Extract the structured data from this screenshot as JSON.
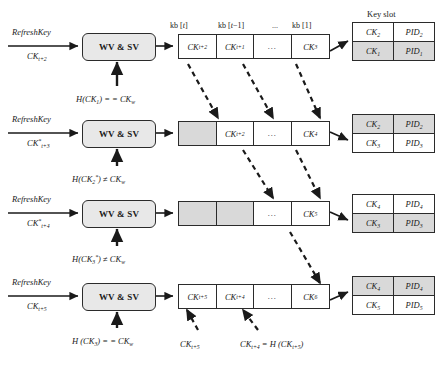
{
  "figure": {
    "key_slot_title": "Key slot",
    "process_box_label": "WV & SV",
    "buffer_headers": [
      "kb [t]",
      "kb [t−1]",
      "...",
      "kb [1]"
    ],
    "rows": [
      {
        "input_top": "RefreshKey",
        "input_bottom": "CK",
        "input_bottom_sub": "t+2",
        "input_bottom_star": "",
        "condition": "H(CK",
        "condition_sub": "1",
        "condition_star": "",
        "condition_tail": ") = = CK",
        "condition_tail_sub": "w",
        "cells": [
          {
            "text": "CK",
            "sub": "t+2",
            "shaded": false,
            "dots": false
          },
          {
            "text": "CK",
            "sub": "t+1",
            "shaded": false,
            "dots": false
          },
          {
            "text": "...",
            "sub": "",
            "shaded": false,
            "dots": true
          },
          {
            "text": "CK",
            "sub": "3",
            "shaded": false,
            "dots": false
          }
        ],
        "slot": [
          {
            "ck": "CK",
            "ck_sub": "2",
            "pid": "PID",
            "pid_sub": "2",
            "shaded": false
          },
          {
            "ck": "CK",
            "ck_sub": "1",
            "pid": "PID",
            "pid_sub": "1",
            "shaded": true
          }
        ]
      },
      {
        "input_top": "RefreshKey",
        "input_bottom": "CK",
        "input_bottom_sub": "t+3",
        "input_bottom_star": "*",
        "condition": "H(CK",
        "condition_sub": "2",
        "condition_star": "*",
        "condition_tail": ") ≠ CK",
        "condition_tail_sub": "w",
        "cells": [
          {
            "text": "",
            "sub": "",
            "shaded": true,
            "dots": false
          },
          {
            "text": "CK",
            "sub": "t+2",
            "shaded": false,
            "dots": false
          },
          {
            "text": "...",
            "sub": "",
            "shaded": false,
            "dots": true
          },
          {
            "text": "CK",
            "sub": "4",
            "shaded": false,
            "dots": false
          }
        ],
        "slot": [
          {
            "ck": "CK",
            "ck_sub": "2",
            "pid": "PID",
            "pid_sub": "2",
            "shaded": true
          },
          {
            "ck": "CK",
            "ck_sub": "3",
            "pid": "PID",
            "pid_sub": "3",
            "shaded": false
          }
        ]
      },
      {
        "input_top": "RefreshKey",
        "input_bottom": "CK",
        "input_bottom_sub": "t+4",
        "input_bottom_star": "*",
        "condition": "H(CK",
        "condition_sub": "3",
        "condition_star": "*",
        "condition_tail": ") ≠ CK",
        "condition_tail_sub": "w",
        "cells": [
          {
            "text": "",
            "sub": "",
            "shaded": true,
            "dots": false
          },
          {
            "text": "",
            "sub": "",
            "shaded": true,
            "dots": false
          },
          {
            "text": "...",
            "sub": "",
            "shaded": false,
            "dots": true
          },
          {
            "text": "CK",
            "sub": "5",
            "shaded": false,
            "dots": false
          }
        ],
        "slot": [
          {
            "ck": "CK",
            "ck_sub": "4",
            "pid": "PID",
            "pid_sub": "4",
            "shaded": false
          },
          {
            "ck": "CK",
            "ck_sub": "3",
            "pid": "PID",
            "pid_sub": "3",
            "shaded": true
          }
        ]
      },
      {
        "input_top": "RefreshKey",
        "input_bottom": "CK",
        "input_bottom_sub": "t+5",
        "input_bottom_star": "",
        "condition": "H (CK",
        "condition_sub": "3",
        "condition_star": "",
        "condition_tail": ") = = CK",
        "condition_tail_sub": "w",
        "cells": [
          {
            "text": "CK",
            "sub": "t+5",
            "shaded": false,
            "dots": false
          },
          {
            "text": "CK",
            "sub": "t+4",
            "shaded": false,
            "dots": false
          },
          {
            "text": "...",
            "sub": "",
            "shaded": false,
            "dots": true
          },
          {
            "text": "CK",
            "sub": "6",
            "shaded": false,
            "dots": false
          }
        ],
        "slot": [
          {
            "ck": "CK",
            "ck_sub": "4",
            "pid": "PID",
            "pid_sub": "4",
            "shaded": true
          },
          {
            "ck": "CK",
            "ck_sub": "5",
            "pid": "PID",
            "pid_sub": "5",
            "shaded": false
          }
        ]
      }
    ],
    "bottom_notes": [
      {
        "text": "CK",
        "sub": "t+5",
        "tail": ""
      },
      {
        "text": "CK",
        "sub": "t+4",
        "tail": " = H (CK",
        "tail2_sub": "t+5",
        "tail3": ")"
      }
    ]
  }
}
